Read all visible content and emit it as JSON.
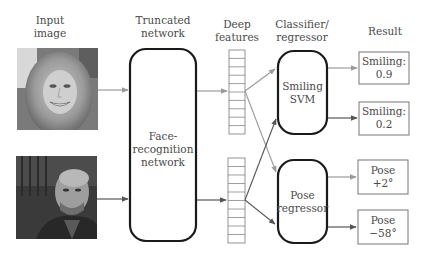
{
  "headers": {
    "input_image": "Input\nimage",
    "truncated_network": "Truncated\nnetwork",
    "deep_features": "Deep\nfeatures",
    "classifier_regressor": "Classifier/\nregressor",
    "result": "Result"
  },
  "network_box": {
    "label": "Face-\nrecognition\nnetwork"
  },
  "classifiers": [
    {
      "label": "Smiling\nSVM"
    },
    {
      "label": "Pose\nregressor"
    }
  ],
  "results": [
    {
      "label": "Smiling:\n0.9"
    },
    {
      "label": "Smiling:\n0.2"
    },
    {
      "label": "Pose\n+2°"
    },
    {
      "label": "Pose\n−58°"
    }
  ],
  "images": [
    {
      "name": "smiling-woman-photo"
    },
    {
      "name": "man-face-photo"
    }
  ],
  "colors": {
    "box_stroke": "#1a1a1a",
    "light_arrow": "#9a9a9a",
    "dark_arrow": "#555555",
    "result_stroke": "#777777",
    "feature_stroke": "#888888"
  }
}
